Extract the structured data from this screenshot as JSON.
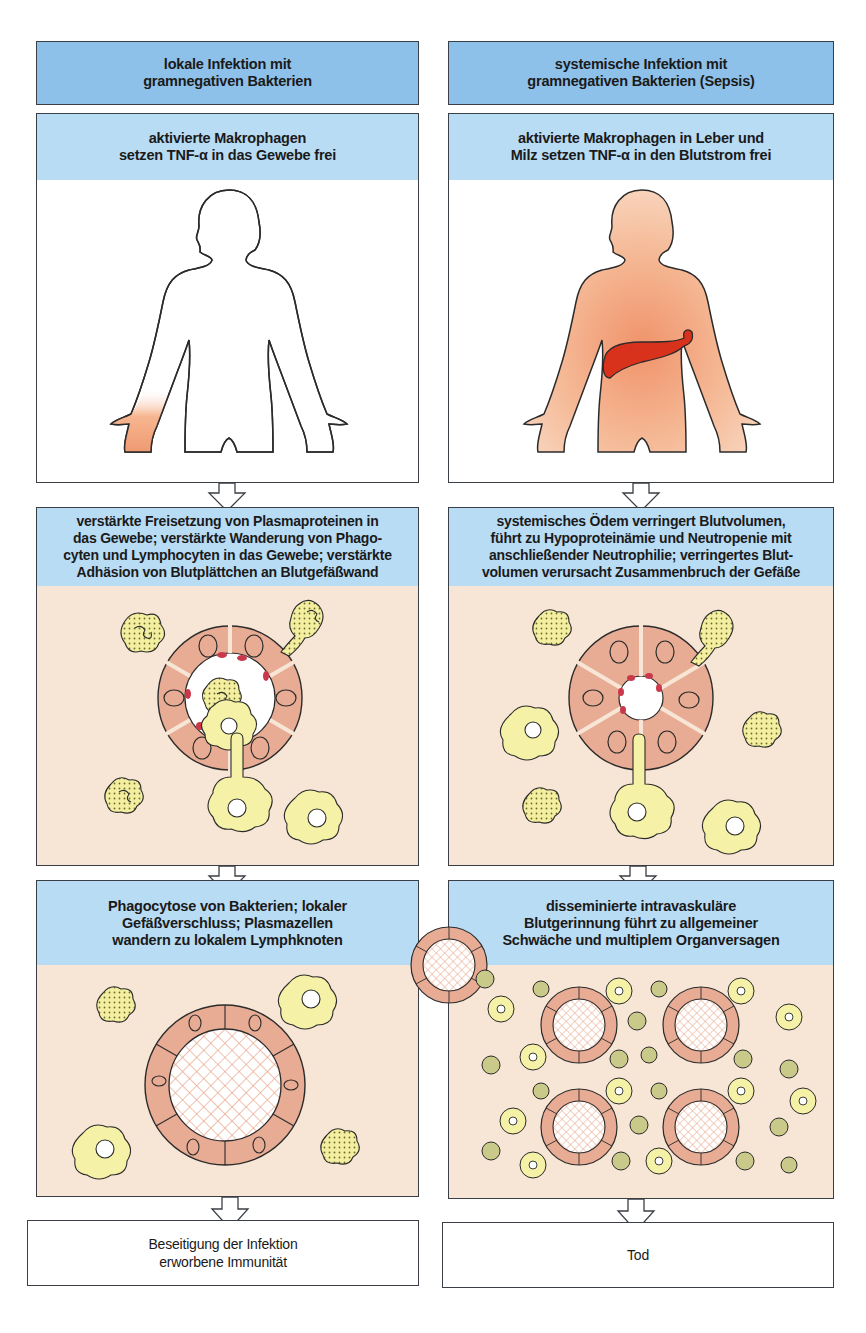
{
  "columns": [
    {
      "id": "local",
      "header": "lokale Infektion mit\ngramnegativen Bakterien",
      "step1": "aktivierte Makrophagen\nsetzen TNF-α in das Gewebe frei",
      "step2": "verstärkte Freisetzung von Plasmaproteinen in\ndas Gewebe; verstärkte Wanderung von Phago-\ncyten und Lymphocyten in das Gewebe; verstärkte\nAdhäsion von Blutplättchen an Blutgefäßwand",
      "step3": "Phagocytose von Bakterien; lokaler\nGefäßverschluss; Plasmazellen\nwandern zu lokalem Lymphknoten",
      "outcome": "Beseitigung der Infektion\nerworbene Immunität",
      "figure": "body-outline-inflamed-hand",
      "vessel_scene": "dilated-vessel-with-migrating-leukocytes",
      "occlusion_scene": "single-occluded-vessel"
    },
    {
      "id": "systemic",
      "header": "systemische Infektion mit\ngramnegativen Bakterien (Sepsis)",
      "step1": "aktivierte Makrophagen in Leber und\nMilz setzen TNF-α in den Blutstrom frei",
      "step2": "systemisches Ödem verringert Blutvolumen,\nführt zu Hypoproteinämie und Neutropenie mit\nanschließender Neutrophilie; verringertes Blut-\nvolumen verursacht Zusammenbruch der Gefäße",
      "step3": "disseminierte intravaskuläre\nBlutgerinnung führt zu allgemeiner\nSchwäche und multiplem Organversagen",
      "outcome": "Tod",
      "figure": "body-filled-with-liver",
      "vessel_scene": "collapsed-vessel-with-leukocytes",
      "occlusion_scene": "four-occluded-vessels"
    }
  ],
  "colors": {
    "header_dark": "#8ec1e9",
    "header_light": "#b9dcf5",
    "tissue": "#f7e6d5",
    "endothelium": "#e8ab94",
    "leukocyte": "#f5f1a6",
    "liver": "#d8321d",
    "skin": "#f3b996",
    "outline": "#3a3f46"
  }
}
